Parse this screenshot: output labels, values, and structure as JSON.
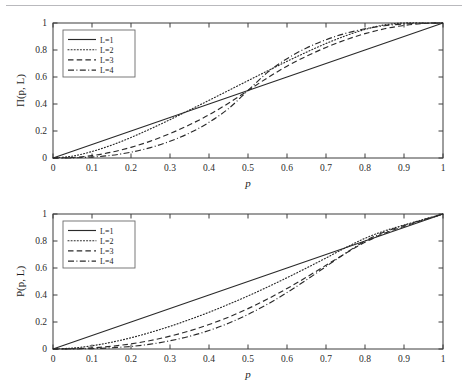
{
  "figure": {
    "panels": [
      {
        "id": "pi-panel",
        "ylabel": "Π(p, L)",
        "xlabel": "p"
      },
      {
        "id": "p-panel",
        "ylabel": "P(p, L)",
        "xlabel": "p"
      }
    ],
    "colors": {
      "curve": "#2a2a2a",
      "axis": "#3c3c3c",
      "rule": "#b9b9bd",
      "background": "#ffffff"
    }
  },
  "chart_data": [
    {
      "type": "line",
      "title": "",
      "xlabel": "p",
      "ylabel": "Π(p, L)",
      "xlim": [
        0,
        1
      ],
      "ylim": [
        0,
        1
      ],
      "xticks": [
        0,
        0.1,
        0.2,
        0.3,
        0.4,
        0.5,
        0.6,
        0.7,
        0.8,
        0.9,
        1
      ],
      "yticks": [
        0,
        0.2,
        0.4,
        0.6,
        0.8,
        1
      ],
      "xticklabels": [
        "0",
        "0.1",
        "0.2",
        "0.3",
        "0.4",
        "0.5",
        "0.6",
        "0.7",
        "0.8",
        "0.9",
        "1"
      ],
      "yticklabels": [
        "0",
        "0.2",
        "0.4",
        "0.6",
        "0.8",
        "1"
      ],
      "grid": false,
      "legend_position": "upper left",
      "x": [
        0,
        0.05,
        0.1,
        0.15,
        0.2,
        0.25,
        0.3,
        0.35,
        0.4,
        0.45,
        0.5,
        0.55,
        0.6,
        0.65,
        0.7,
        0.75,
        0.8,
        0.85,
        0.9,
        0.95,
        1
      ],
      "series": [
        {
          "name": "L=1",
          "style": "solid",
          "values": [
            0,
            0.05,
            0.1,
            0.15,
            0.2,
            0.25,
            0.3,
            0.35,
            0.4,
            0.45,
            0.5,
            0.55,
            0.6,
            0.65,
            0.7,
            0.75,
            0.8,
            0.85,
            0.9,
            0.95,
            1
          ]
        },
        {
          "name": "L=2",
          "style": "dotted",
          "values": [
            0,
            0.014,
            0.048,
            0.095,
            0.152,
            0.216,
            0.284,
            0.355,
            0.427,
            0.5,
            0.573,
            0.645,
            0.716,
            0.784,
            0.848,
            0.905,
            0.952,
            0.986,
            1.0,
            1.0,
            1.0
          ]
        },
        {
          "name": "L=3",
          "style": "dashed",
          "values": [
            0,
            0.004,
            0.018,
            0.043,
            0.079,
            0.125,
            0.181,
            0.246,
            0.32,
            0.406,
            0.5,
            0.594,
            0.68,
            0.754,
            0.819,
            0.875,
            0.921,
            0.957,
            0.982,
            0.996,
            1.0
          ]
        },
        {
          "name": "L=4",
          "style": "dashdot",
          "values": [
            0,
            0.001,
            0.007,
            0.02,
            0.043,
            0.077,
            0.124,
            0.185,
            0.264,
            0.366,
            0.5,
            0.634,
            0.736,
            0.815,
            0.876,
            0.923,
            0.957,
            0.98,
            0.993,
            0.999,
            1.0
          ]
        }
      ]
    },
    {
      "type": "line",
      "title": "",
      "xlabel": "p",
      "ylabel": "P(p, L)",
      "xlim": [
        0,
        1
      ],
      "ylim": [
        0,
        1
      ],
      "xticks": [
        0,
        0.1,
        0.2,
        0.3,
        0.4,
        0.5,
        0.6,
        0.7,
        0.8,
        0.9,
        1
      ],
      "yticks": [
        0,
        0.2,
        0.4,
        0.6,
        0.8,
        1
      ],
      "xticklabels": [
        "0",
        "0.1",
        "0.2",
        "0.3",
        "0.4",
        "0.5",
        "0.6",
        "0.7",
        "0.8",
        "0.9",
        "1"
      ],
      "yticklabels": [
        "0",
        "0.2",
        "0.4",
        "0.6",
        "0.8",
        "1"
      ],
      "grid": false,
      "legend_position": "upper left",
      "x": [
        0,
        0.05,
        0.1,
        0.15,
        0.2,
        0.25,
        0.3,
        0.35,
        0.4,
        0.45,
        0.5,
        0.55,
        0.6,
        0.65,
        0.7,
        0.75,
        0.8,
        0.85,
        0.9,
        0.95,
        1
      ],
      "series": [
        {
          "name": "L=1",
          "style": "solid",
          "values": [
            0,
            0.05,
            0.1,
            0.15,
            0.2,
            0.25,
            0.3,
            0.35,
            0.4,
            0.45,
            0.5,
            0.55,
            0.6,
            0.65,
            0.7,
            0.75,
            0.8,
            0.85,
            0.9,
            0.95,
            1
          ]
        },
        {
          "name": "L=2",
          "style": "dotted",
          "values": [
            0,
            0.007,
            0.024,
            0.05,
            0.083,
            0.123,
            0.168,
            0.218,
            0.272,
            0.331,
            0.393,
            0.459,
            0.528,
            0.6,
            0.674,
            0.75,
            0.82,
            0.875,
            0.918,
            0.96,
            1
          ]
        },
        {
          "name": "L=3",
          "style": "dashed",
          "values": [
            0,
            0.002,
            0.008,
            0.02,
            0.038,
            0.063,
            0.095,
            0.134,
            0.181,
            0.236,
            0.299,
            0.37,
            0.448,
            0.532,
            0.62,
            0.708,
            0.79,
            0.857,
            0.908,
            0.955,
            1
          ]
        },
        {
          "name": "L=4",
          "style": "dashdot",
          "values": [
            0,
            0.001,
            0.003,
            0.009,
            0.019,
            0.036,
            0.061,
            0.094,
            0.137,
            0.191,
            0.256,
            0.332,
            0.418,
            0.512,
            0.611,
            0.709,
            0.8,
            0.866,
            0.915,
            0.958,
            1
          ]
        }
      ]
    }
  ]
}
